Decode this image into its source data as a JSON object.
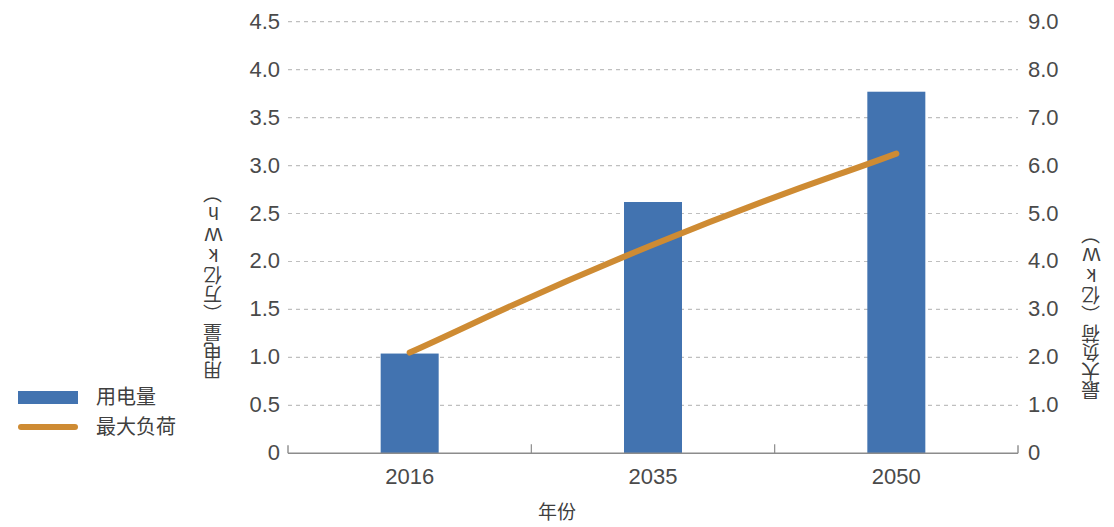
{
  "chart_data": {
    "type": "bar",
    "title": "",
    "subtitle": "",
    "xlabel": "年份",
    "ylabel": "用电量（万亿kWh）",
    "y2label": "最大负荷（亿kW）",
    "categories": [
      "2016",
      "2035",
      "2050"
    ],
    "ylim": [
      0,
      4.5
    ],
    "y2lim": [
      0,
      9.0
    ],
    "y_ticks": [
      "0",
      "0.5",
      "1.0",
      "1.5",
      "2.0",
      "2.5",
      "3.0",
      "3.5",
      "4.0",
      "4.5"
    ],
    "y_tick_values": [
      0,
      0.5,
      1.0,
      1.5,
      2.0,
      2.5,
      3.0,
      3.5,
      4.0,
      4.5
    ],
    "y2_ticks": [
      "0",
      "1.0",
      "2.0",
      "3.0",
      "4.0",
      "5.0",
      "6.0",
      "7.0",
      "8.0",
      "9.0"
    ],
    "y2_tick_values": [
      0,
      1.0,
      2.0,
      3.0,
      4.0,
      5.0,
      6.0,
      7.0,
      8.0,
      9.0
    ],
    "grid": true,
    "grid_style": "dotted-horizontal",
    "legend_position": "left-middle",
    "series": [
      {
        "name": "用电量",
        "type": "bar",
        "axis": "left",
        "color": "#4273b0",
        "values": [
          1.04,
          2.62,
          3.77
        ]
      },
      {
        "name": "最大负荷",
        "type": "line",
        "axis": "right",
        "color": "#ce8b33",
        "smooth": true,
        "values": [
          2.1,
          4.35,
          6.25
        ]
      }
    ]
  },
  "legend": {
    "items": [
      {
        "label": "用电量",
        "color": "#4273b0",
        "marker": "bar"
      },
      {
        "label": "最大负荷",
        "color": "#ce8b33",
        "marker": "line"
      }
    ]
  },
  "colors": {
    "bar": "#4273b0",
    "line": "#ce8b33",
    "axis": "#8c8c8c",
    "grid": "#bfbfbf",
    "text": "#3f3f3f"
  }
}
